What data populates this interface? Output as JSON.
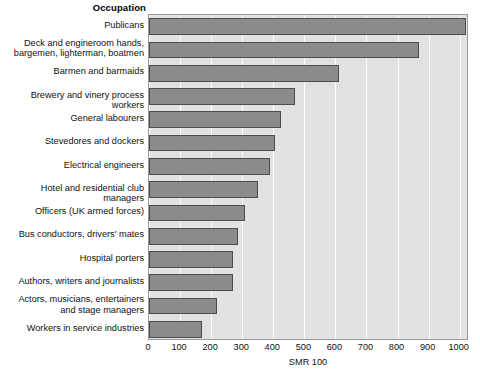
{
  "header": {
    "occupation_label": "Occupation"
  },
  "axis": {
    "title": "SMR 100",
    "ticks": [
      "0",
      "100",
      "200",
      "300",
      "400",
      "500",
      "600",
      "700",
      "800",
      "900",
      "1000"
    ]
  },
  "colors": {
    "bar_fill": "#8b8b8b",
    "bar_border": "#4c4c4c",
    "plot_background": "#e2e2e2",
    "gridline": "#fdfdfd",
    "plot_border": "#9a9a9a"
  },
  "chart_data": {
    "type": "bar",
    "orientation": "horizontal",
    "title": "",
    "xlabel": "SMR 100",
    "ylabel": "Occupation",
    "xlim": [
      0,
      1030
    ],
    "xticks": [
      0,
      100,
      200,
      300,
      400,
      500,
      600,
      700,
      800,
      900,
      1000
    ],
    "grid": true,
    "legend": false,
    "categories": [
      "Publicans",
      "Deck and engineroom hands,\nbargemen, lighterman, boatmen",
      "Barmen and barmaids",
      "Brewery and vinery process workers",
      "General labourers",
      "Stevedores and dockers",
      "Electrical engineers",
      "Hotel and residential club managers",
      "Officers (UK armed forces)",
      "Bus conductors, drivers' mates",
      "Hospital porters",
      "Authors, writers and journalists",
      "Actors, musicians, entertainers\nand stage managers",
      "Workers in service industries"
    ],
    "values": [
      1020,
      870,
      610,
      470,
      425,
      405,
      390,
      350,
      310,
      285,
      270,
      270,
      220,
      170
    ]
  }
}
